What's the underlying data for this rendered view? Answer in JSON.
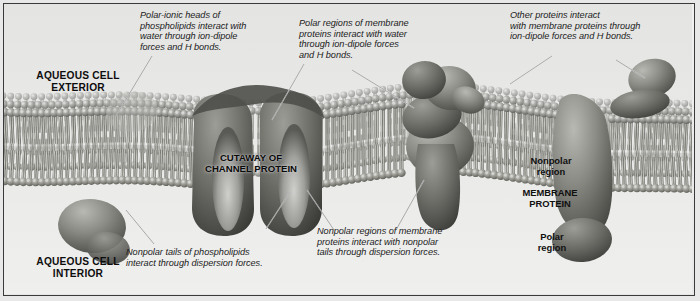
{
  "figure": {
    "kind": "cell-membrane-cutaway-illustration",
    "style": "grayscale-airbrush-textbook-art",
    "frame_color": "#3a3a3a",
    "background_color": "#ececed"
  },
  "region_labels": {
    "exterior": "AQUEOUS CELL\nEXTERIOR",
    "interior": "AQUEOUS CELL\nINTERIOR",
    "cutaway": "CUTAWAY OF\nCHANNEL PROTEIN",
    "membrane_protein": "MEMBRANE\nPROTEIN",
    "nonpolar_region": "Nonpolar\nregion",
    "polar_region": "Polar\nregion"
  },
  "annotations": [
    {
      "id": "polar-ionic-heads",
      "text": "Polar-ionic heads of\nphospholipids interact with\nwater through ion-dipole\nforces and H bonds."
    },
    {
      "id": "polar-regions-proteins",
      "text": "Polar regions of membrane\nproteins interact with water\nthrough ion-dipole forces\nand H bonds."
    },
    {
      "id": "other-proteins",
      "text": "Other proteins interact\nwith membrane proteins through\nion-dipole forces and H bonds."
    },
    {
      "id": "nonpolar-tails",
      "text": "Nonpolar tails of phospholipids\ninteract through dispersion forces."
    },
    {
      "id": "nonpolar-regions-proteins",
      "text": "Nonpolar regions of membrane\nproteins interact with nonpolar\ntails through dispersion forces."
    }
  ],
  "structures": [
    {
      "id": "lipid-bilayer",
      "name": "phospholipid bilayer"
    },
    {
      "id": "channel-protein",
      "name": "channel protein cutaway"
    },
    {
      "id": "peripheral-protein-cluster",
      "name": "membrane protein with attached proteins"
    },
    {
      "id": "membrane-protein-right",
      "name": "transmembrane protein"
    },
    {
      "id": "interior-protein",
      "name": "cytoplasmic protein"
    },
    {
      "id": "exterior-protein-right",
      "name": "extracellular protein pair"
    }
  ]
}
